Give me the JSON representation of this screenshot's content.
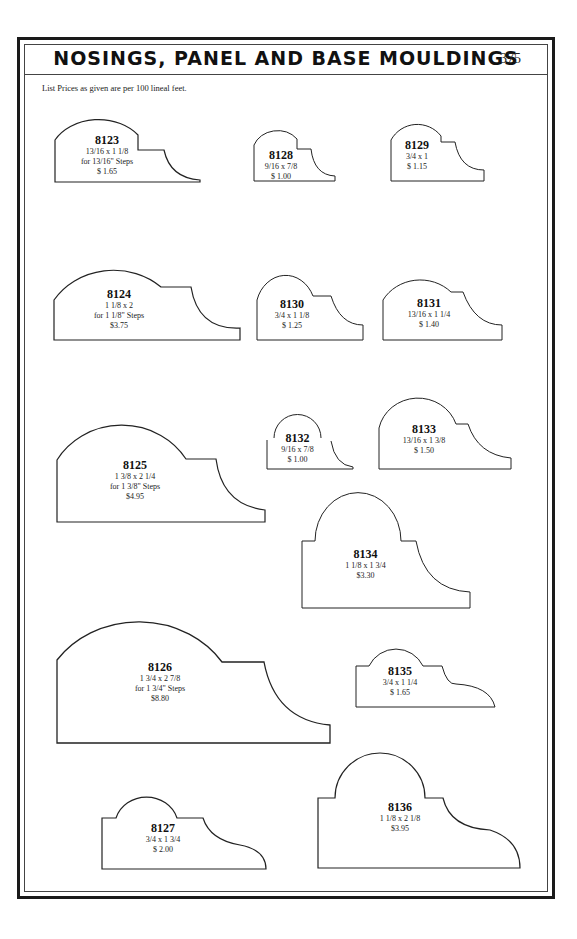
{
  "header": {
    "title": "NOSINGS, PANEL AND BASE MOULDINGS",
    "page_number": "375"
  },
  "note": "List Prices as given are per 100 lineal feet.",
  "mouldings": [
    {
      "id": "8123",
      "size": "13/16 x 1 1/8",
      "steps": "for 13/16\" Steps",
      "price": "$ 1.65"
    },
    {
      "id": "8128",
      "size": "9/16 x 7/8",
      "steps": "",
      "price": "$ 1.00"
    },
    {
      "id": "8129",
      "size": "3/4 x 1",
      "steps": "",
      "price": "$ 1.15"
    },
    {
      "id": "8124",
      "size": "1 1/8 x 2",
      "steps": "for 1 1/8\" Steps",
      "price": "$3.75"
    },
    {
      "id": "8130",
      "size": "3/4 x 1 1/8",
      "steps": "",
      "price": "$ 1.25"
    },
    {
      "id": "8131",
      "size": "13/16 x 1 1/4",
      "steps": "",
      "price": "$ 1.40"
    },
    {
      "id": "8125",
      "size": "1 3/8 x 2 1/4",
      "steps": "for 1 3/8\" Steps",
      "price": "$4.95"
    },
    {
      "id": "8132",
      "size": "9/16 x 7/8",
      "steps": "",
      "price": "$ 1.00"
    },
    {
      "id": "8133",
      "size": "13/16 x 1 3/8",
      "steps": "",
      "price": "$ 1.50"
    },
    {
      "id": "8134",
      "size": "1 1/8 x 1 3/4",
      "steps": "",
      "price": "$3.30"
    },
    {
      "id": "8126",
      "size": "1 3/4 x 2 7/8",
      "steps": "for 1 3/4\" Steps",
      "price": "$8.80"
    },
    {
      "id": "8135",
      "size": "3/4 x 1 1/4",
      "steps": "",
      "price": "$ 1.65"
    },
    {
      "id": "8127",
      "size": "3/4 x 1 3/4",
      "steps": "",
      "price": "$ 2.00"
    },
    {
      "id": "8136",
      "size": "1 1/8 x 2 1/8",
      "steps": "",
      "price": "$3.95"
    }
  ]
}
